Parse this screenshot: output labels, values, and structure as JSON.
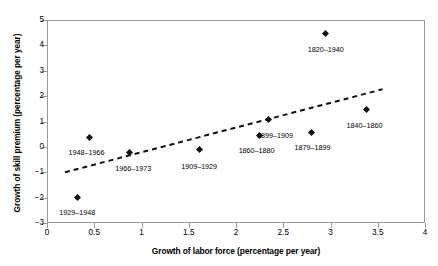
{
  "chart_data": {
    "type": "scatter",
    "title": "",
    "xlabel": "Growth of labor force (percentage per year)",
    "ylabel": "Growth of skill premium (percentage per year)",
    "xlim": [
      0,
      4
    ],
    "ylim": [
      -3,
      5
    ],
    "xticks": [
      "0",
      "0.5",
      "1",
      "1.5",
      "2",
      "2.5",
      "3",
      "3.5",
      "4"
    ],
    "xtick_values": [
      0,
      0.5,
      1,
      1.5,
      2,
      2.5,
      3,
      3.5,
      4
    ],
    "yticks": [
      "5",
      "4",
      "3",
      "2",
      "1",
      "0",
      "−1",
      "−2",
      "−3"
    ],
    "ytick_values": [
      5,
      4,
      3,
      2,
      1,
      0,
      -1,
      -2,
      -3
    ],
    "grid": false,
    "legend": false,
    "marker_color": "#111111",
    "frame_color": "#9a9a9a",
    "points": [
      {
        "label": "1929–1948",
        "x": 0.32,
        "y": -2.0,
        "label_dx": 0,
        "label_dy": 11
      },
      {
        "label": "1948–1966",
        "x": 0.45,
        "y": 0.35,
        "label_dx": -3,
        "label_dy": 11
      },
      {
        "label": "1966–1973",
        "x": 0.87,
        "y": -0.22,
        "label_dx": 4,
        "label_dy": 13
      },
      {
        "label": "1909–1929",
        "x": 1.61,
        "y": -0.12,
        "label_dx": 0,
        "label_dy": 13
      },
      {
        "label": "1860–1880",
        "x": 2.25,
        "y": 0.45,
        "label_dx": -3,
        "label_dy": 12
      },
      {
        "label": "1899–1909",
        "x": 2.34,
        "y": 1.07,
        "label_dx": 7,
        "label_dy": 12
      },
      {
        "label": "1879–1899",
        "x": 2.8,
        "y": 0.57,
        "label_dx": 1,
        "label_dy": 12
      },
      {
        "label": "1820–1940",
        "x": 2.95,
        "y": 4.45,
        "label_dx": 0,
        "label_dy": 12
      },
      {
        "label": "1840–1860",
        "x": 3.38,
        "y": 1.47,
        "label_dx": -2,
        "label_dy": 12
      }
    ],
    "trendline": {
      "style": "dashed",
      "color": "#111111",
      "x_start": 0.19,
      "y_start": -1.0,
      "x_end": 3.55,
      "y_end": 2.27
    }
  }
}
